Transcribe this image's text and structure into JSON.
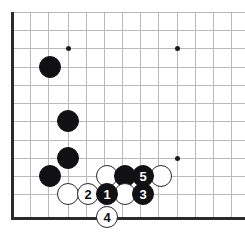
{
  "figure": {
    "kind": "go-board-diagram",
    "board_size": 19,
    "view": "bottom-left corner",
    "colors": {
      "background": "#ffffff",
      "grid_line": "#b9b9bd",
      "edge_line": "#2b2b2e",
      "black_stone": "#111114",
      "white_stone": "#ffffff",
      "stone_outline": "#2a2a2d",
      "star_point": "#1b1b1e",
      "black_label_text": "#ffffff",
      "white_label_text": "#111114"
    }
  },
  "grid": {
    "columns_x": [
      12,
      30,
      48,
      68,
      86,
      104,
      122,
      140,
      158,
      177,
      195,
      213,
      231
    ],
    "rows_y": [
      12,
      30,
      48,
      67,
      85,
      103,
      121,
      140,
      158,
      176,
      194,
      217
    ],
    "left_edge_x": 12,
    "bottom_edge_y": 217,
    "spacing": 18
  },
  "star_points": [
    {
      "name": "star-point-upper-left",
      "x": 68,
      "y": 48
    },
    {
      "name": "star-point-upper-right",
      "x": 177,
      "y": 48
    },
    {
      "name": "star-point-lower-right",
      "x": 177,
      "y": 158
    }
  ],
  "stones": [
    {
      "id": "black-stone-a",
      "color": "black",
      "label": "",
      "x": 50,
      "y": 67
    },
    {
      "id": "black-stone-b",
      "color": "black",
      "label": "",
      "x": 68,
      "y": 121
    },
    {
      "id": "black-stone-c",
      "color": "black",
      "label": "",
      "x": 68,
      "y": 158
    },
    {
      "id": "black-stone-d",
      "color": "black",
      "label": "",
      "x": 50,
      "y": 176
    },
    {
      "id": "white-stone-e",
      "color": "white",
      "label": "",
      "x": 107,
      "y": 176
    },
    {
      "id": "black-stone-f",
      "color": "black",
      "label": "",
      "x": 125,
      "y": 176
    },
    {
      "id": "white-stone-g",
      "color": "white",
      "label": "",
      "x": 161,
      "y": 176
    },
    {
      "id": "white-stone-h",
      "color": "white",
      "label": "",
      "x": 68,
      "y": 194
    },
    {
      "id": "white-stone-i",
      "color": "white",
      "label": "",
      "x": 125,
      "y": 194
    },
    {
      "id": "move-2",
      "color": "white",
      "label": "2",
      "x": 88,
      "y": 194
    },
    {
      "id": "move-1",
      "color": "black",
      "label": "1",
      "x": 107,
      "y": 194
    },
    {
      "id": "move-3",
      "color": "black",
      "label": "3",
      "x": 143,
      "y": 194
    },
    {
      "id": "move-5",
      "color": "black",
      "label": "5",
      "x": 143,
      "y": 176
    },
    {
      "id": "move-4",
      "color": "white",
      "label": "4",
      "x": 107,
      "y": 217
    }
  ],
  "move_sequence": [
    {
      "number": "1",
      "color": "black"
    },
    {
      "number": "2",
      "color": "white"
    },
    {
      "number": "3",
      "color": "black"
    },
    {
      "number": "4",
      "color": "white"
    },
    {
      "number": "5",
      "color": "black"
    }
  ]
}
